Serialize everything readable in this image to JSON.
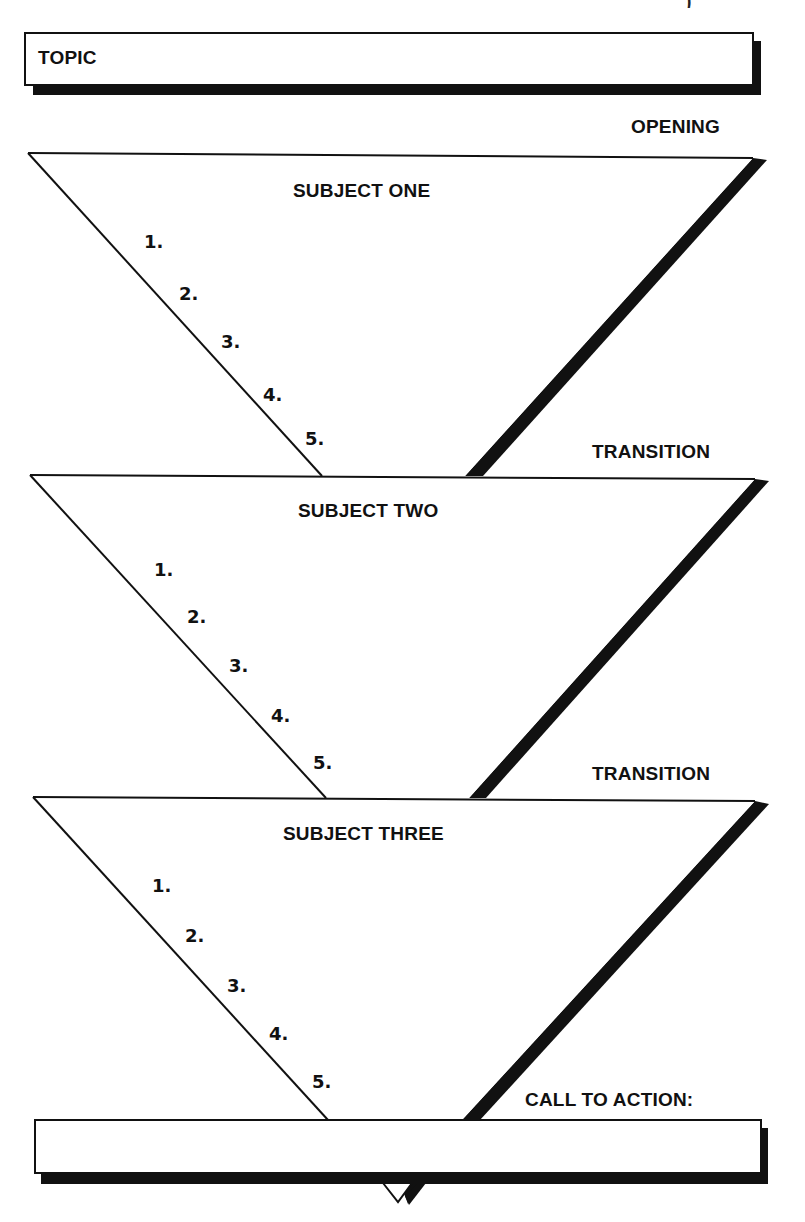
{
  "diagram": {
    "type": "speech-outline-funnel",
    "topic_box": {
      "label": "TOPIC",
      "value": ""
    },
    "cropped_header_text": ")",
    "sections": [
      {
        "marker": "OPENING",
        "subject": "SUBJECT ONE",
        "points": [
          "1.",
          "2.",
          "3.",
          "4.",
          "5."
        ]
      },
      {
        "marker": "TRANSITION",
        "subject": "SUBJECT TWO",
        "points": [
          "1.",
          "2.",
          "3.",
          "4.",
          "5."
        ]
      },
      {
        "marker": "TRANSITION",
        "subject": "SUBJECT THREE",
        "points": [
          "1.",
          "2.",
          "3.",
          "4.",
          "5."
        ]
      }
    ],
    "call_to_action": {
      "label": "CALL TO ACTION:",
      "value": ""
    },
    "colors": {
      "line": "#111111",
      "shadow": "#111111",
      "fill": "#ffffff"
    }
  }
}
